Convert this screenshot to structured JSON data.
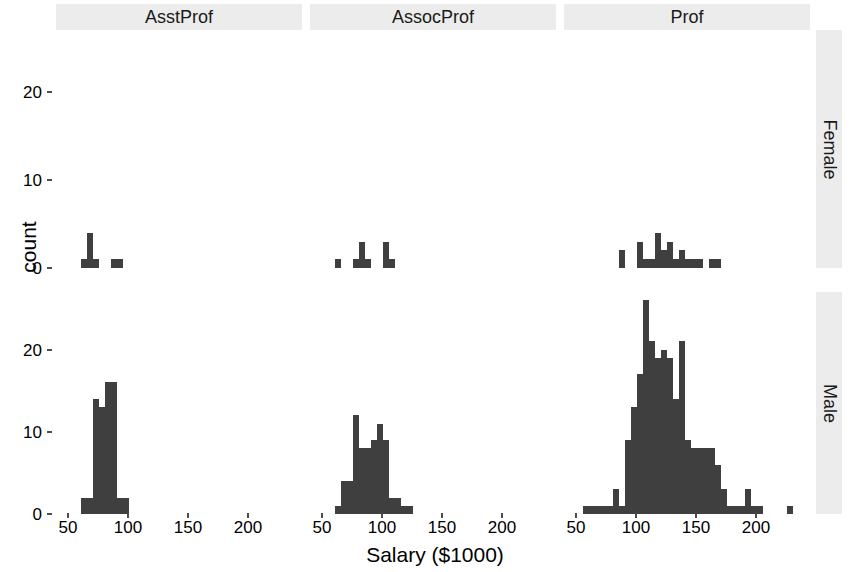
{
  "chart_data": {
    "type": "bar",
    "chart_kind": "faceted-histogram",
    "title": "",
    "xlabel": "Salary ($1000)",
    "ylabel": "count",
    "xlim": [
      40,
      245
    ],
    "ylim": [
      0,
      27
    ],
    "xticks": [
      50,
      100,
      150,
      200
    ],
    "yticks": [
      0,
      10,
      20
    ],
    "grid": false,
    "legend": "none",
    "bar_color": "#3f3f3f",
    "strip_color": "#ececec",
    "panel_background": "#ffffff",
    "facet_cols": [
      "AsstProf",
      "AssocProf",
      "Prof"
    ],
    "facet_rows": [
      "Female",
      "Male"
    ],
    "bin_width": 5,
    "panels": [
      {
        "row": "Female",
        "col": "AsstProf",
        "bins": [
          {
            "x": 63,
            "count": 1
          },
          {
            "x": 68,
            "count": 4
          },
          {
            "x": 73,
            "count": 1
          },
          {
            "x": 78,
            "count": 0
          },
          {
            "x": 83,
            "count": 0
          },
          {
            "x": 88,
            "count": 1
          },
          {
            "x": 93,
            "count": 1
          }
        ]
      },
      {
        "row": "Female",
        "col": "AssocProf",
        "bins": [
          {
            "x": 63,
            "count": 1
          },
          {
            "x": 68,
            "count": 0
          },
          {
            "x": 73,
            "count": 0
          },
          {
            "x": 78,
            "count": 1
          },
          {
            "x": 83,
            "count": 3
          },
          {
            "x": 88,
            "count": 1
          },
          {
            "x": 93,
            "count": 0
          },
          {
            "x": 98,
            "count": 0
          },
          {
            "x": 103,
            "count": 3
          },
          {
            "x": 108,
            "count": 1
          }
        ]
      },
      {
        "row": "Female",
        "col": "Prof",
        "bins": [
          {
            "x": 88,
            "count": 2
          },
          {
            "x": 93,
            "count": 0
          },
          {
            "x": 98,
            "count": 0
          },
          {
            "x": 103,
            "count": 3
          },
          {
            "x": 108,
            "count": 1
          },
          {
            "x": 113,
            "count": 1
          },
          {
            "x": 118,
            "count": 4
          },
          {
            "x": 123,
            "count": 2
          },
          {
            "x": 128,
            "count": 3
          },
          {
            "x": 133,
            "count": 1
          },
          {
            "x": 138,
            "count": 2
          },
          {
            "x": 143,
            "count": 1
          },
          {
            "x": 148,
            "count": 1
          },
          {
            "x": 153,
            "count": 1
          },
          {
            "x": 158,
            "count": 0
          },
          {
            "x": 163,
            "count": 1
          },
          {
            "x": 168,
            "count": 1
          }
        ]
      },
      {
        "row": "Male",
        "col": "AsstProf",
        "bins": [
          {
            "x": 63,
            "count": 2
          },
          {
            "x": 68,
            "count": 2
          },
          {
            "x": 73,
            "count": 14
          },
          {
            "x": 78,
            "count": 13
          },
          {
            "x": 83,
            "count": 16
          },
          {
            "x": 88,
            "count": 16
          },
          {
            "x": 93,
            "count": 2
          },
          {
            "x": 98,
            "count": 2
          }
        ]
      },
      {
        "row": "Male",
        "col": "AssocProf",
        "bins": [
          {
            "x": 63,
            "count": 1
          },
          {
            "x": 68,
            "count": 4
          },
          {
            "x": 73,
            "count": 4
          },
          {
            "x": 78,
            "count": 12
          },
          {
            "x": 83,
            "count": 8
          },
          {
            "x": 88,
            "count": 8
          },
          {
            "x": 93,
            "count": 9
          },
          {
            "x": 98,
            "count": 11
          },
          {
            "x": 103,
            "count": 9
          },
          {
            "x": 108,
            "count": 2
          },
          {
            "x": 113,
            "count": 2
          },
          {
            "x": 118,
            "count": 1
          },
          {
            "x": 123,
            "count": 1
          }
        ]
      },
      {
        "row": "Male",
        "col": "Prof",
        "bins": [
          {
            "x": 58,
            "count": 1
          },
          {
            "x": 63,
            "count": 1
          },
          {
            "x": 68,
            "count": 1
          },
          {
            "x": 73,
            "count": 1
          },
          {
            "x": 78,
            "count": 1
          },
          {
            "x": 83,
            "count": 3
          },
          {
            "x": 88,
            "count": 1
          },
          {
            "x": 93,
            "count": 9
          },
          {
            "x": 98,
            "count": 13
          },
          {
            "x": 103,
            "count": 17
          },
          {
            "x": 108,
            "count": 26
          },
          {
            "x": 113,
            "count": 21
          },
          {
            "x": 118,
            "count": 19
          },
          {
            "x": 123,
            "count": 20
          },
          {
            "x": 128,
            "count": 19
          },
          {
            "x": 133,
            "count": 14
          },
          {
            "x": 138,
            "count": 21
          },
          {
            "x": 143,
            "count": 9
          },
          {
            "x": 148,
            "count": 8
          },
          {
            "x": 153,
            "count": 8
          },
          {
            "x": 158,
            "count": 8
          },
          {
            "x": 163,
            "count": 8
          },
          {
            "x": 168,
            "count": 6
          },
          {
            "x": 173,
            "count": 3
          },
          {
            "x": 178,
            "count": 1
          },
          {
            "x": 183,
            "count": 1
          },
          {
            "x": 188,
            "count": 1
          },
          {
            "x": 193,
            "count": 3
          },
          {
            "x": 198,
            "count": 1
          },
          {
            "x": 203,
            "count": 1
          },
          {
            "x": 208,
            "count": 0
          },
          {
            "x": 228,
            "count": 1
          }
        ]
      }
    ]
  },
  "axis": {
    "ylabel": "count",
    "xlabel": "Salary ($1000)",
    "yticks": [
      "0",
      "10",
      "20"
    ],
    "xticks": [
      "50",
      "100",
      "150",
      "200"
    ]
  },
  "strips": {
    "columns": [
      "AsstProf",
      "AssocProf",
      "Prof"
    ],
    "rows": [
      "Female",
      "Male"
    ]
  }
}
